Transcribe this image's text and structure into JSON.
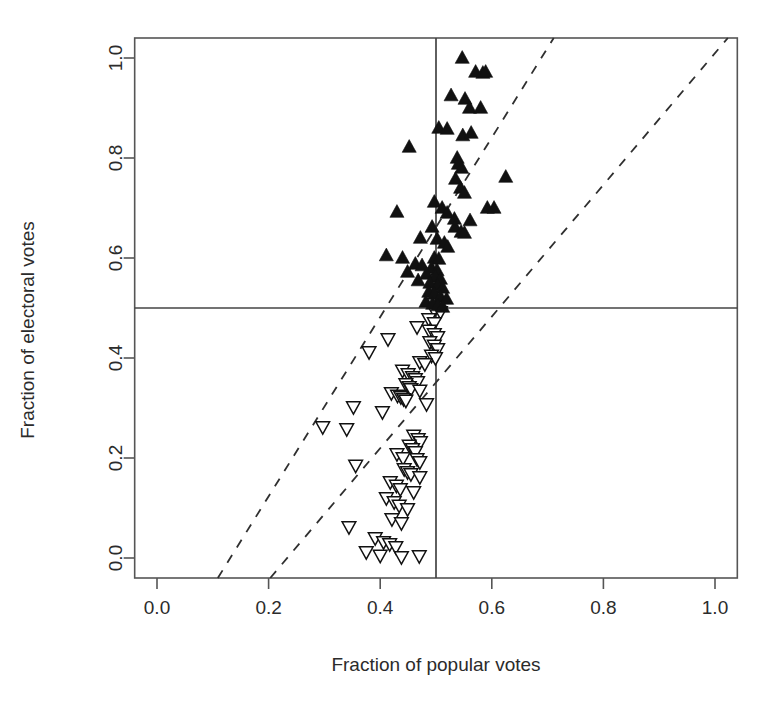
{
  "chart_data": {
    "type": "scatter",
    "title": "",
    "xlabel": "Fraction of popular votes",
    "ylabel": "Fraction of electoral votes",
    "xlim": [
      -0.04,
      1.04
    ],
    "ylim": [
      -0.04,
      1.04
    ],
    "xticks": [
      0.0,
      0.2,
      0.4,
      0.6,
      0.8,
      1.0
    ],
    "yticks": [
      0.0,
      0.2,
      0.4,
      0.6,
      0.8,
      1.0
    ],
    "xtick_labels": [
      "0.0",
      "0.2",
      "0.4",
      "0.6",
      "0.8",
      "1.0"
    ],
    "ytick_labels": [
      "0.0",
      "0.2",
      "0.4",
      "0.6",
      "0.8",
      "1.0"
    ],
    "grid": false,
    "legend": "none",
    "reference_lines": [
      {
        "name": "vertical-half-line",
        "orientation": "vertical",
        "value": 0.5,
        "style": "solid"
      },
      {
        "name": "horizontal-half-line",
        "orientation": "horizontal",
        "value": 0.5,
        "style": "solid"
      }
    ],
    "dashed_lines": [
      {
        "name": "upper-dashed-line",
        "style": "dashed",
        "x": [
          0.109,
          0.711
        ],
        "y": [
          -0.04,
          1.04
        ]
      },
      {
        "name": "lower-dashed-line",
        "style": "dashed",
        "x": [
          0.203,
          1.023
        ],
        "y": [
          -0.04,
          1.04
        ]
      }
    ],
    "series": [
      {
        "name": "winners",
        "marker": "filled-triangle-up",
        "color": "#111111",
        "points": [
          [
            0.547,
            1.0
          ],
          [
            0.571,
            0.972
          ],
          [
            0.584,
            0.97
          ],
          [
            0.589,
            0.972
          ],
          [
            0.527,
            0.925
          ],
          [
            0.552,
            0.918
          ],
          [
            0.56,
            0.9
          ],
          [
            0.58,
            0.9
          ],
          [
            0.505,
            0.86
          ],
          [
            0.52,
            0.858
          ],
          [
            0.548,
            0.845
          ],
          [
            0.563,
            0.85
          ],
          [
            0.452,
            0.822
          ],
          [
            0.538,
            0.8
          ],
          [
            0.54,
            0.788
          ],
          [
            0.546,
            0.78
          ],
          [
            0.625,
            0.762
          ],
          [
            0.535,
            0.758
          ],
          [
            0.544,
            0.74
          ],
          [
            0.551,
            0.73
          ],
          [
            0.497,
            0.712
          ],
          [
            0.511,
            0.7
          ],
          [
            0.592,
            0.7
          ],
          [
            0.604,
            0.7
          ],
          [
            0.43,
            0.692
          ],
          [
            0.52,
            0.69
          ],
          [
            0.533,
            0.678
          ],
          [
            0.561,
            0.675
          ],
          [
            0.493,
            0.662
          ],
          [
            0.534,
            0.662
          ],
          [
            0.545,
            0.652
          ],
          [
            0.551,
            0.65
          ],
          [
            0.472,
            0.64
          ],
          [
            0.502,
            0.638
          ],
          [
            0.515,
            0.63
          ],
          [
            0.521,
            0.622
          ],
          [
            0.411,
            0.605
          ],
          [
            0.44,
            0.6
          ],
          [
            0.497,
            0.6
          ],
          [
            0.505,
            0.598
          ],
          [
            0.463,
            0.588
          ],
          [
            0.475,
            0.585
          ],
          [
            0.492,
            0.58
          ],
          [
            0.502,
            0.575
          ],
          [
            0.449,
            0.572
          ],
          [
            0.483,
            0.568
          ],
          [
            0.499,
            0.562
          ],
          [
            0.508,
            0.558
          ],
          [
            0.468,
            0.555
          ],
          [
            0.489,
            0.55
          ],
          [
            0.503,
            0.545
          ],
          [
            0.512,
            0.54
          ],
          [
            0.487,
            0.532
          ],
          [
            0.497,
            0.528
          ],
          [
            0.508,
            0.522
          ],
          [
            0.519,
            0.518
          ],
          [
            0.482,
            0.512
          ],
          [
            0.494,
            0.508
          ],
          [
            0.503,
            0.505
          ],
          [
            0.512,
            0.502
          ]
        ]
      },
      {
        "name": "losers",
        "marker": "open-triangle-down",
        "color": "#ffffff",
        "points": [
          [
            0.497,
            0.495
          ],
          [
            0.508,
            0.492
          ],
          [
            0.487,
            0.478
          ],
          [
            0.497,
            0.47
          ],
          [
            0.466,
            0.462
          ],
          [
            0.488,
            0.455
          ],
          [
            0.497,
            0.448
          ],
          [
            0.503,
            0.442
          ],
          [
            0.414,
            0.438
          ],
          [
            0.489,
            0.432
          ],
          [
            0.497,
            0.425
          ],
          [
            0.503,
            0.418
          ],
          [
            0.38,
            0.412
          ],
          [
            0.492,
            0.405
          ],
          [
            0.499,
            0.4
          ],
          [
            0.471,
            0.392
          ],
          [
            0.48,
            0.388
          ],
          [
            0.44,
            0.375
          ],
          [
            0.45,
            0.368
          ],
          [
            0.458,
            0.362
          ],
          [
            0.463,
            0.358
          ],
          [
            0.467,
            0.352
          ],
          [
            0.446,
            0.348
          ],
          [
            0.452,
            0.342
          ],
          [
            0.455,
            0.338
          ],
          [
            0.471,
            0.335
          ],
          [
            0.42,
            0.33
          ],
          [
            0.431,
            0.325
          ],
          [
            0.437,
            0.322
          ],
          [
            0.442,
            0.318
          ],
          [
            0.446,
            0.315
          ],
          [
            0.483,
            0.308
          ],
          [
            0.352,
            0.302
          ],
          [
            0.404,
            0.292
          ],
          [
            0.297,
            0.262
          ],
          [
            0.34,
            0.258
          ],
          [
            0.46,
            0.245
          ],
          [
            0.468,
            0.238
          ],
          [
            0.472,
            0.232
          ],
          [
            0.452,
            0.225
          ],
          [
            0.458,
            0.218
          ],
          [
            0.463,
            0.212
          ],
          [
            0.43,
            0.208
          ],
          [
            0.441,
            0.2
          ],
          [
            0.466,
            0.198
          ],
          [
            0.471,
            0.192
          ],
          [
            0.356,
            0.185
          ],
          [
            0.443,
            0.178
          ],
          [
            0.449,
            0.172
          ],
          [
            0.455,
            0.168
          ],
          [
            0.471,
            0.162
          ],
          [
            0.418,
            0.152
          ],
          [
            0.429,
            0.145
          ],
          [
            0.436,
            0.138
          ],
          [
            0.46,
            0.132
          ],
          [
            0.411,
            0.12
          ],
          [
            0.425,
            0.112
          ],
          [
            0.434,
            0.105
          ],
          [
            0.449,
            0.098
          ],
          [
            0.421,
            0.078
          ],
          [
            0.438,
            0.07
          ],
          [
            0.344,
            0.062
          ],
          [
            0.391,
            0.04
          ],
          [
            0.406,
            0.032
          ],
          [
            0.417,
            0.028
          ],
          [
            0.428,
            0.022
          ],
          [
            0.375,
            0.012
          ],
          [
            0.4,
            0.005
          ],
          [
            0.438,
            0.002
          ],
          [
            0.47,
            0.004
          ]
        ]
      }
    ]
  }
}
